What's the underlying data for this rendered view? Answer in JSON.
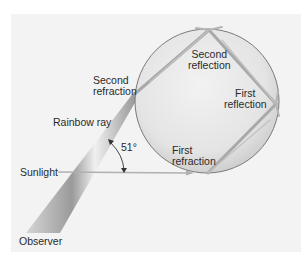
{
  "diagram": {
    "labels": {
      "second_reflection": [
        "Second",
        "reflection"
      ],
      "second_refraction": [
        "Second",
        "refraction"
      ],
      "first_reflection": [
        "First",
        "reflection"
      ],
      "first_refraction": [
        "First",
        "refraction"
      ],
      "rainbow_ray": "Rainbow ray",
      "angle": "51°",
      "sunlight": "Sunlight",
      "observer": "Observer"
    },
    "colors": {
      "background": "#ffffff",
      "panel": "#f3f3f3",
      "droplet_fill": "#e6e6e6",
      "droplet_edge": "#7a7a7a",
      "ray": "#a8a8a8",
      "text": "#2a2a2a"
    }
  }
}
